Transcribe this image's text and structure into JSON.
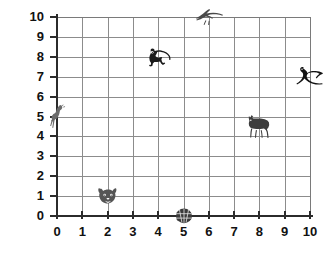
{
  "chart_data": {
    "type": "scatter",
    "title": "",
    "xlabel": "",
    "ylabel": "",
    "xlim": [
      0,
      10
    ],
    "ylim": [
      0,
      10
    ],
    "grid": true,
    "legend": "none",
    "x_ticks": [
      "0",
      "1",
      "2",
      "3",
      "4",
      "5",
      "6",
      "7",
      "8",
      "9",
      "10"
    ],
    "y_ticks": [
      "0",
      "1",
      "2",
      "3",
      "4",
      "5",
      "6",
      "7",
      "8",
      "9",
      "10"
    ],
    "marker_style": "animal-pictogram",
    "points": [
      {
        "label": "giraffe",
        "icon": "giraffe-icon",
        "x": 0,
        "y": 5,
        "color": "#6b6b6b"
      },
      {
        "label": "tiger",
        "icon": "tiger-face-icon",
        "x": 2,
        "y": 1,
        "color": "#555555"
      },
      {
        "label": "panda",
        "icon": "panda-icon",
        "x": 4,
        "y": 8,
        "color": "#1a1a1a"
      },
      {
        "label": "turtle",
        "icon": "turtle-icon",
        "x": 5,
        "y": 0,
        "color": "#3a3a3a"
      },
      {
        "label": "eagle",
        "icon": "eagle-icon",
        "x": 6,
        "y": 10,
        "color": "#4a4a4a"
      },
      {
        "label": "wolf",
        "icon": "wolf-icon",
        "x": 8,
        "y": 4.5,
        "color": "#3d3d3d"
      },
      {
        "label": "seal",
        "icon": "seal-icon",
        "x": 10,
        "y": 7,
        "color": "#111111"
      }
    ]
  },
  "style": {
    "grid_color": "#8c8c8c",
    "axis_color": "#2b2b2b",
    "label_color": "#111111",
    "background": "#ffffff"
  }
}
